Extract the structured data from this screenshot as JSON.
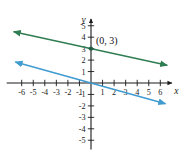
{
  "chart_data": {
    "type": "line",
    "title": "",
    "xlabel": "x",
    "ylabel": "y",
    "xlim": [
      -7.3,
      7.0
    ],
    "ylim": [
      -5.8,
      5.6
    ],
    "grid": false,
    "legend": null,
    "x_ticks": [
      -6,
      -5,
      -4,
      -3,
      -2,
      -1,
      1,
      2,
      3,
      4,
      5,
      6
    ],
    "y_ticks": [
      -5,
      -4,
      -3,
      -2,
      -1,
      1,
      2,
      3,
      4,
      5
    ],
    "x_tick_labels": [
      "-6",
      "-5",
      "-4",
      "-3",
      "-2",
      "-1",
      "1",
      "2",
      "3",
      "4",
      "5",
      "6"
    ],
    "y_tick_labels": [
      "-5",
      "-4",
      "-3",
      "-2",
      "-1",
      "1",
      "2",
      "3",
      "4",
      "5"
    ],
    "annotations": [
      {
        "text": "(0, 3)",
        "x": 0,
        "y": 3
      }
    ],
    "points": [
      {
        "x": 0,
        "y": 3,
        "marker": "dot",
        "color": "#1d5c3f"
      }
    ],
    "series": [
      {
        "name": "green-line",
        "color": "#2f7d52",
        "intercept": 3,
        "slope": -0.22,
        "x_start": -6.7,
        "x_end": 6.6,
        "arrow_start": true,
        "arrow_end": true
      },
      {
        "name": "blue-line",
        "color": "#3f9bd0",
        "intercept": 0,
        "slope": -0.28,
        "x_start": -6.55,
        "x_end": 6.45,
        "arrow_start": true,
        "arrow_end": true
      }
    ]
  },
  "axes": {
    "x_axis_name": "x",
    "y_axis_name": "y",
    "axis_color": "#1a1a1a"
  },
  "colors": {
    "green": "#2f7d52",
    "blue": "#3f9bd0",
    "axis": "#1a1a1a",
    "background": "#ffffff"
  }
}
